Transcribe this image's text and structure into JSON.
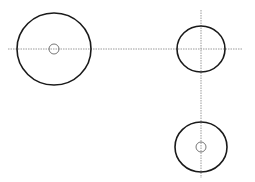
{
  "diagram": {
    "width": 255,
    "height": 182,
    "background": "#ffffff",
    "stroke_color": "#1a1a1a",
    "guide_color": "#9a9a9a",
    "guides": [
      {
        "name": "horizontal-centerline",
        "x1": 8,
        "y1": 49,
        "x2": 242,
        "y2": 49
      },
      {
        "name": "vertical-centerline",
        "x1": 201,
        "y1": 10,
        "x2": 201,
        "y2": 178
      }
    ],
    "circles": [
      {
        "name": "large-left-circle",
        "cx": 54,
        "cy": 49,
        "rx": 37,
        "ry": 36,
        "stroke_width": 1.6
      },
      {
        "name": "left-inner-hole",
        "cx": 54,
        "cy": 49,
        "r": 5,
        "stroke_width": 0.8
      },
      {
        "name": "top-right-circle",
        "cx": 201,
        "cy": 49,
        "rx": 24,
        "ry": 23,
        "stroke_width": 1.6
      },
      {
        "name": "bottom-right-circle",
        "cx": 201,
        "cy": 147,
        "rx": 26,
        "ry": 25,
        "stroke_width": 1.6
      },
      {
        "name": "bottom-inner-hole",
        "cx": 201,
        "cy": 147,
        "r": 5,
        "stroke_width": 0.8
      }
    ]
  }
}
